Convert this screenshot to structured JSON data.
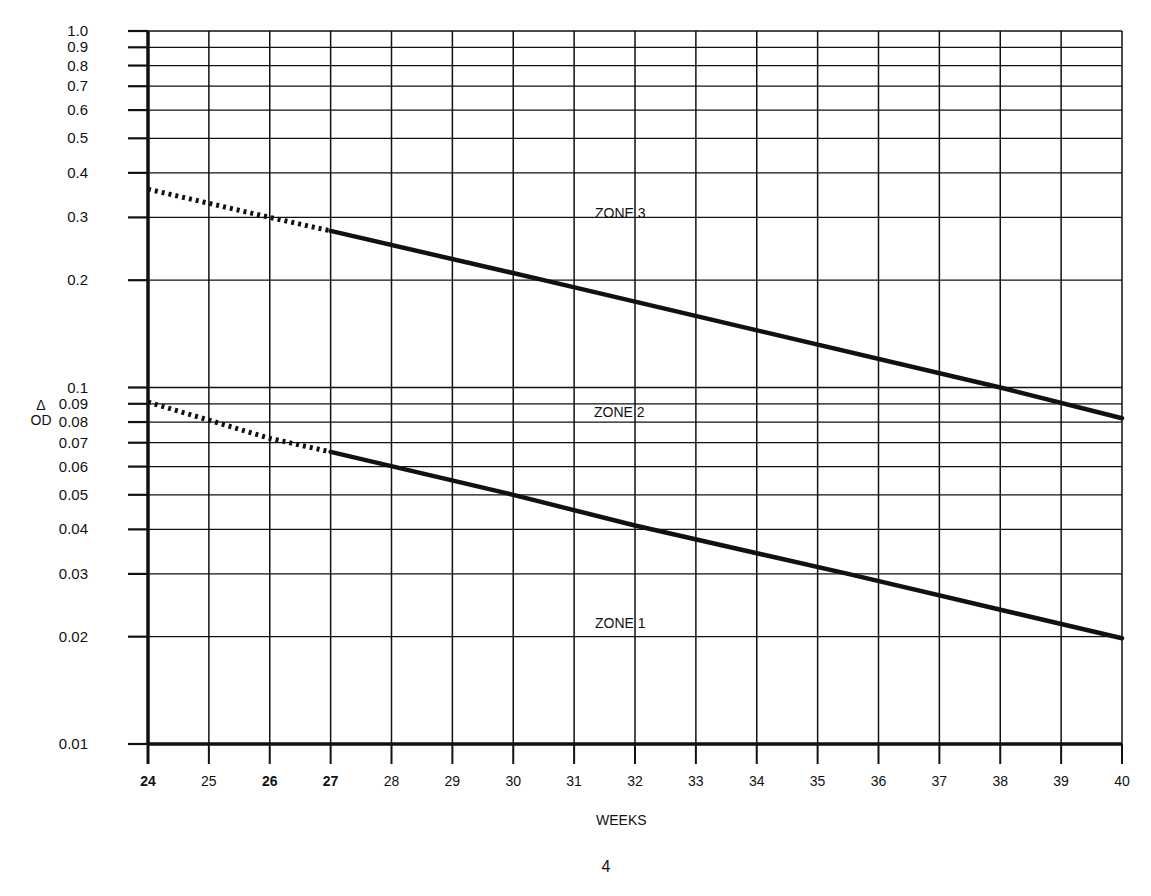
{
  "chart_data": {
    "type": "line",
    "title": "",
    "xlabel": "WEEKS",
    "ylabel_symbol": "Δ",
    "ylabel": "OD",
    "yscale": "log",
    "xlim": [
      24,
      40
    ],
    "ylim": [
      0.01,
      1.0
    ],
    "grid": true,
    "x_ticks": [
      24,
      25,
      26,
      27,
      28,
      29,
      30,
      31,
      32,
      33,
      34,
      35,
      36,
      37,
      38,
      39,
      40
    ],
    "x_tick_labels": [
      "24",
      "25",
      "26",
      "27",
      "28",
      "29",
      "30",
      "31",
      "32",
      "33",
      "34",
      "35",
      "36",
      "37",
      "38",
      "39",
      "40"
    ],
    "y_ticks": [
      0.01,
      0.02,
      0.03,
      0.04,
      0.05,
      0.06,
      0.07,
      0.08,
      0.09,
      0.1,
      0.2,
      0.3,
      0.4,
      0.5,
      0.6,
      0.7,
      0.8,
      0.9,
      1.0
    ],
    "y_tick_labels": [
      "0.01",
      "0.02",
      "0.03",
      "0.04",
      "0.05",
      "0.06",
      "0.07",
      "0.08",
      "0.09",
      "0.1",
      "0.2",
      "0.3",
      "0.4",
      "0.5",
      "0.6",
      "0.7",
      "0.8",
      "0.9",
      "1.0"
    ],
    "series": [
      {
        "name": "Upper zone boundary (Zone 2 / Zone 3)",
        "style": "dotted 24-27, solid 27-40",
        "x": [
          24,
          26,
          27,
          30.5,
          38,
          40
        ],
        "values": [
          0.36,
          0.3,
          0.275,
          0.2,
          0.1,
          0.082
        ]
      },
      {
        "name": "Lower zone boundary (Zone 1 / Zone 2)",
        "style": "dotted 24-27, solid 27-40",
        "x": [
          24,
          25,
          26,
          27,
          30,
          32,
          35.5,
          40
        ],
        "values": [
          0.091,
          0.081,
          0.072,
          0.066,
          0.05,
          0.041,
          0.03,
          0.0198
        ]
      }
    ],
    "annotations": [
      {
        "text": "ZONE 3",
        "x": 32,
        "y": 0.32
      },
      {
        "text": "ZONE 2",
        "x": 32,
        "y": 0.093
      },
      {
        "text": "ZONE 1",
        "x": 32,
        "y": 0.023
      }
    ]
  },
  "labels": {
    "zone3": "ZONE 3",
    "zone2": "ZONE 2",
    "zone1": "ZONE 1",
    "ylabel_symbol": "Δ",
    "ylabel": "OD",
    "xlabel": "WEEKS",
    "page_number": "4"
  },
  "colors": {
    "ink": "#111111",
    "background": "#ffffff"
  }
}
